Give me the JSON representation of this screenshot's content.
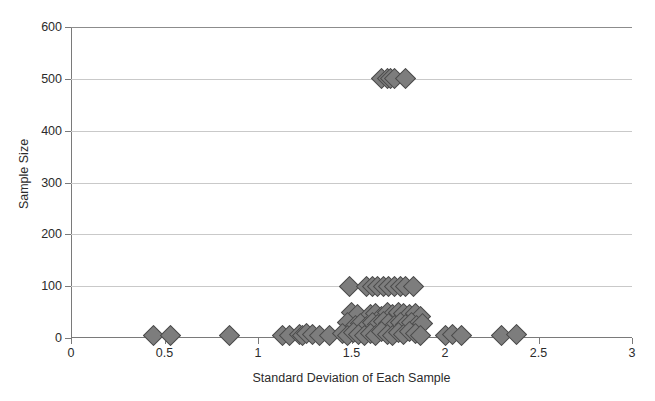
{
  "chart_data": {
    "type": "scatter",
    "title": "",
    "xlabel": "Standard Deviation of Each Sample",
    "ylabel": "Sample Size",
    "xlim": [
      0,
      3
    ],
    "ylim": [
      0,
      600
    ],
    "xticks": [
      "0",
      "0.5",
      "1",
      "1.5",
      "2",
      "2.5",
      "3"
    ],
    "xtick_values": [
      0,
      0.5,
      1,
      1.5,
      2,
      2.5,
      3
    ],
    "yticks": [
      "0",
      "100",
      "200",
      "300",
      "400",
      "500",
      "600"
    ],
    "ytick_values": [
      0,
      100,
      200,
      300,
      400,
      500,
      600
    ],
    "grid": true,
    "grid_axis": "y",
    "legend": false,
    "marker": "diamond",
    "marker_color": "#7d7d7d",
    "marker_edge_color": "#4a4a4a",
    "grid_color": "#c9c9c9",
    "axis_color": "#7a7a7a",
    "background": "#ffffff",
    "points": [
      [
        1.66,
        500
      ],
      [
        1.69,
        500
      ],
      [
        1.71,
        500
      ],
      [
        1.73,
        500
      ],
      [
        1.79,
        500
      ],
      [
        1.49,
        100
      ],
      [
        1.58,
        100
      ],
      [
        1.61,
        100
      ],
      [
        1.64,
        100
      ],
      [
        1.67,
        100
      ],
      [
        1.7,
        100
      ],
      [
        1.73,
        100
      ],
      [
        1.76,
        100
      ],
      [
        1.79,
        100
      ],
      [
        1.83,
        100
      ],
      [
        1.5,
        50
      ],
      [
        1.53,
        45
      ],
      [
        1.6,
        45
      ],
      [
        1.63,
        48
      ],
      [
        1.66,
        42
      ],
      [
        1.69,
        50
      ],
      [
        1.72,
        46
      ],
      [
        1.75,
        50
      ],
      [
        1.78,
        48
      ],
      [
        1.81,
        45
      ],
      [
        1.84,
        48
      ],
      [
        1.87,
        42
      ],
      [
        1.48,
        30
      ],
      [
        1.52,
        25
      ],
      [
        1.55,
        28
      ],
      [
        1.58,
        22
      ],
      [
        1.61,
        30
      ],
      [
        1.64,
        26
      ],
      [
        1.67,
        32
      ],
      [
        1.7,
        28
      ],
      [
        1.73,
        24
      ],
      [
        1.76,
        30
      ],
      [
        1.79,
        26
      ],
      [
        1.82,
        30
      ],
      [
        1.85,
        24
      ],
      [
        1.88,
        28
      ],
      [
        0.44,
        5
      ],
      [
        0.53,
        5
      ],
      [
        0.85,
        5
      ],
      [
        1.13,
        5
      ],
      [
        1.17,
        4
      ],
      [
        1.22,
        6
      ],
      [
        1.24,
        5
      ],
      [
        1.26,
        8
      ],
      [
        1.29,
        6
      ],
      [
        1.33,
        5
      ],
      [
        1.38,
        5
      ],
      [
        1.45,
        8
      ],
      [
        1.48,
        5
      ],
      [
        1.51,
        10
      ],
      [
        1.54,
        6
      ],
      [
        1.57,
        4
      ],
      [
        1.6,
        9
      ],
      [
        1.63,
        5
      ],
      [
        1.66,
        12
      ],
      [
        1.69,
        7
      ],
      [
        1.72,
        4
      ],
      [
        1.75,
        10
      ],
      [
        1.78,
        6
      ],
      [
        1.81,
        12
      ],
      [
        1.84,
        8
      ],
      [
        1.87,
        5
      ],
      [
        2.0,
        5
      ],
      [
        2.04,
        6
      ],
      [
        2.09,
        5
      ],
      [
        2.3,
        5
      ],
      [
        2.38,
        6
      ]
    ]
  }
}
